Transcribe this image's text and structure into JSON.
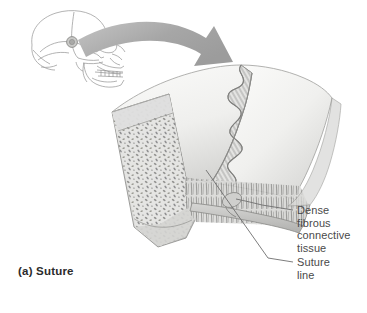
{
  "figure": {
    "caption": "(a) Suture",
    "background_color": "#ffffff",
    "labels": [
      {
        "id": "dense-fibrous-connective-tissue",
        "text": "Dense\nfibrous\nconnective\ntissue",
        "color": "#4a4a4a"
      },
      {
        "id": "suture-line",
        "text": "Suture\nline",
        "color": "#4a4a4a"
      }
    ],
    "parts": {
      "skull_inset": "lateral-skull-line-drawing",
      "callout_arrow": "curved-gray-arrow",
      "bone_block": "cut-away-cranial-bone-block",
      "suture_seam": "interdigitating-wavy-suture",
      "spongy_bone": "diploe-trabecular-texture",
      "compact_bone": "outer-inner-compact-tables"
    },
    "colors": {
      "bone_light": "#f4f4f2",
      "bone_mid": "#d8d8d6",
      "bone_shadow": "#b9b9b7",
      "outline": "#8e8e8e",
      "arrow": "#a8a8a8",
      "skull_line": "#9a9a9a",
      "label_text": "#4a4a4a",
      "caption_text": "#2b2b2b",
      "leader_line": "#6e6e6e"
    }
  }
}
